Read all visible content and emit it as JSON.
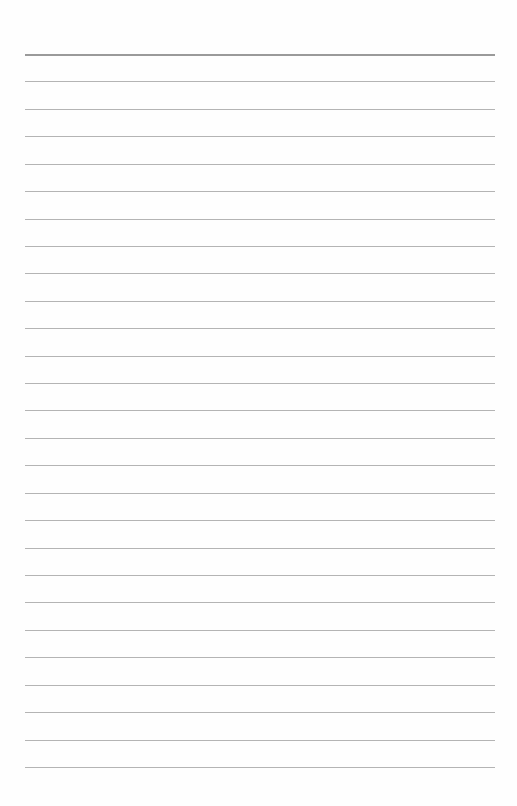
{
  "page": {
    "type": "blank lined paper",
    "background_color": "#fefefe",
    "rule_color": "#b4b4b4",
    "top_rule_color": "#9a9a9a",
    "rule_count": 27,
    "first_rule_y": 54,
    "rule_spacing": 27.42,
    "rule_left": 25,
    "rule_right": 495
  }
}
